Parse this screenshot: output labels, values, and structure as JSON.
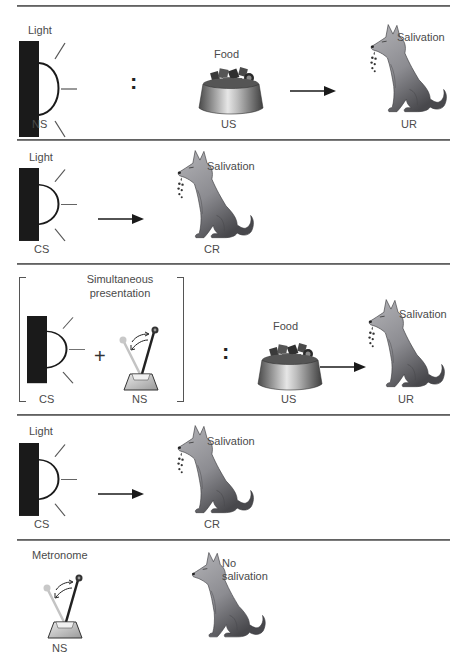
{
  "colors": {
    "divider": "#5a5a5a",
    "light_box": "#1a1a1a",
    "dog_light": "#a9a9ad",
    "dog_dark": "#4e4e52",
    "label_text": "#4a4a4a"
  },
  "panels": [
    {
      "id": "before-conditioning",
      "stimulus_label": "Light",
      "stimulus_role": "NS",
      "separator": ":",
      "food_label": "Food",
      "food_role": "US",
      "response_label": "Salivation",
      "response_role": "UR"
    },
    {
      "id": "light-alone-cs",
      "stimulus_label": "Light",
      "stimulus_role": "CS",
      "response_label": "Salivation",
      "response_role": "CR"
    },
    {
      "id": "higher-order-pairing",
      "group_label": "Simultaneous presentation",
      "group_label_line1": "Simultaneous",
      "group_label_line2": "presentation",
      "stimulus_role": "CS",
      "plus": "+",
      "second_stimulus_role": "NS",
      "separator": ":",
      "food_label": "Food",
      "food_role": "US",
      "response_label": "Salivation",
      "response_role": "UR"
    },
    {
      "id": "light-test",
      "stimulus_label": "Light",
      "stimulus_role": "CS",
      "response_label": "Salivation",
      "response_role": "CR"
    },
    {
      "id": "metronome-test",
      "stimulus_label": "Metronome",
      "stimulus_role": "NS",
      "response_label_line1": "No",
      "response_label_line2": "salivation"
    }
  ],
  "icons": [
    "light-icon",
    "food-bowl-icon",
    "dog-icon",
    "metronome-icon",
    "arrow-right-icon",
    "drool-icon"
  ]
}
